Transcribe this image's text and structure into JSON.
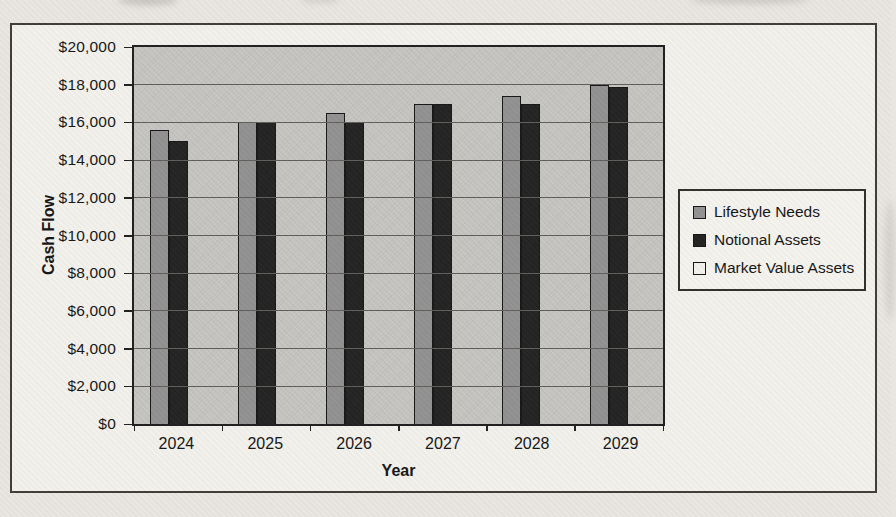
{
  "chart_data": {
    "type": "bar",
    "title": "",
    "xlabel": "Year",
    "ylabel": "Cash Flow",
    "categories": [
      "2024",
      "2025",
      "2026",
      "2027",
      "2028",
      "2029"
    ],
    "series": [
      {
        "name": "Lifestyle Needs",
        "color": "#919191",
        "values": [
          15600,
          16000,
          16500,
          17000,
          17400,
          18000
        ]
      },
      {
        "name": "Notional Assets",
        "color": "#1f1f1f",
        "values": [
          15000,
          16000,
          16000,
          17000,
          17000,
          17900
        ]
      },
      {
        "name": "Market Value Assets",
        "color": "#f2f1ec",
        "values": [
          0,
          0,
          0,
          0,
          0,
          0
        ]
      }
    ],
    "ylim": [
      0,
      20000
    ],
    "ytick_interval": 2000,
    "ytick_labels": [
      "$20,000",
      "$18,000",
      "$16,000",
      "$14,000",
      "$12,000",
      "$10,000",
      "$8,000",
      "$6,000",
      "$4,000",
      "$2,000",
      "$0"
    ],
    "grid": true,
    "legend_position": "right",
    "colors": {
      "plot_background": "#c6c5c2",
      "frame_background": "#f2f1ec",
      "page_background": "#e9e6e1",
      "gridline": "#5d5c59",
      "axis_text": "#121212"
    }
  }
}
